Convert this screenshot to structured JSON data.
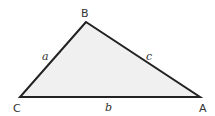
{
  "diagram": {
    "type": "triangle",
    "fill_color": "#f0f0f0",
    "stroke_color": "#222222",
    "vertices": [
      {
        "id": "B",
        "label": "B",
        "x": 86,
        "y": 22
      },
      {
        "id": "C",
        "label": "C",
        "x": 20,
        "y": 97
      },
      {
        "id": "A",
        "label": "A",
        "x": 200,
        "y": 97
      }
    ],
    "sides": [
      {
        "id": "a",
        "label": "a",
        "between": [
          "C",
          "B"
        ]
      },
      {
        "id": "b",
        "label": "b",
        "between": [
          "C",
          "A"
        ]
      },
      {
        "id": "c",
        "label": "c",
        "between": [
          "B",
          "A"
        ]
      }
    ]
  }
}
